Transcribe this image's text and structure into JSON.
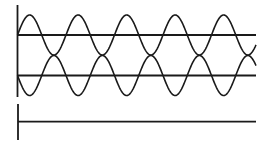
{
  "diagram": {
    "stroke_color": "#1a1a1a",
    "background": "#ffffff",
    "top_panel": {
      "axis": {
        "x": 17.5,
        "y1": 5,
        "y2": 97
      },
      "waves": [
        {
          "name": "wave-1",
          "baseline_y": 35,
          "amplitude": 20,
          "x_start": 17.5,
          "x_end": 256,
          "period": 48.5,
          "phase": "up"
        },
        {
          "name": "wave-2",
          "baseline_y": 75.5,
          "amplitude": 20,
          "x_start": 17.5,
          "x_end": 256,
          "period": 48.5,
          "phase": "down"
        }
      ]
    },
    "bottom_panel": {
      "axis": {
        "x": 18,
        "y1": 104,
        "y2": 140
      },
      "flat_line": {
        "y": 121.7,
        "x_start": 18,
        "x_end": 256
      }
    }
  }
}
